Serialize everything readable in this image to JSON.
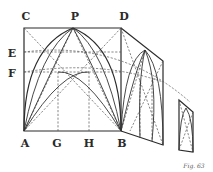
{
  "figure": {
    "caption": "Fig. 63",
    "labels": {
      "C": "C",
      "P": "P",
      "D": "D",
      "E": "E",
      "F": "F",
      "A": "A",
      "G": "G",
      "H": "H",
      "B": "B"
    }
  }
}
